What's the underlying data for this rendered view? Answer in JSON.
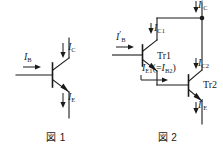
{
  "page": {
    "width": 223,
    "height": 150,
    "background": "#ffffff",
    "ink_color": "#1a1a1a"
  },
  "figures": [
    {
      "id": "fig1",
      "caption": "図 1",
      "description": "single NPN bipolar transistor with base, collector and emitter current labels",
      "labels": {
        "base_current": {
          "symbol": "I",
          "sub": "B",
          "prime": "",
          "text": "I_B"
        },
        "collector_current": {
          "symbol": "I",
          "sub": "C",
          "prime": "",
          "text": "I_C"
        },
        "emitter_current": {
          "symbol": "I",
          "sub": "E",
          "prime": "",
          "text": "I_E"
        }
      }
    },
    {
      "id": "fig2",
      "caption": "図 2",
      "description": "Darlington pair of two NPN transistors Tr1 and Tr2 with labelled currents",
      "transistors": [
        {
          "name": "Tr1"
        },
        {
          "name": "Tr2"
        }
      ],
      "labels": {
        "base_current": {
          "symbol": "I",
          "sub": "B",
          "prime": "′",
          "text": "I'_B"
        },
        "collector_current_total": {
          "symbol": "I",
          "sub": "C",
          "prime": "′",
          "text": "I'_C"
        },
        "collector_current_tr1": {
          "symbol": "I",
          "sub": "C1",
          "prime": "",
          "text": "I_C1"
        },
        "collector_current_tr2": {
          "symbol": "I",
          "sub": "C2",
          "prime": "",
          "text": "I_C2"
        },
        "emitter_current_tr1": {
          "symbol": "I",
          "sub": "E1",
          "prime": "",
          "text": "I_E1"
        },
        "base_current_tr2": {
          "symbol": "I",
          "sub": "B2",
          "prime": "",
          "text": "I_B2"
        },
        "equality_open": "(=",
        "equality_close": ")",
        "emitter_current_total": {
          "symbol": "I",
          "sub": "E",
          "prime": "′",
          "text": "I'_E"
        }
      }
    }
  ]
}
